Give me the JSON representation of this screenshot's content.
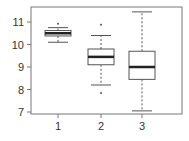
{
  "chart_data": {
    "type": "box",
    "title": "",
    "xlabel": "",
    "ylabel": "",
    "categories": [
      "1",
      "2",
      "3"
    ],
    "ylim": [
      6.95,
      11.5
    ],
    "yticks": [
      7,
      8,
      9,
      10,
      11
    ],
    "ytick_labels": [
      "7",
      "8",
      "9",
      "10",
      "11"
    ],
    "xtick_labels": [
      "1",
      "2",
      "3"
    ],
    "grid": false,
    "legend": null,
    "boxes": [
      {
        "label": "1",
        "whisker_low": 10.1,
        "q1": 10.38,
        "median": 10.5,
        "q3": 10.62,
        "whisker_high": 10.75,
        "outliers": [
          10.92
        ]
      },
      {
        "label": "2",
        "whisker_low": 8.2,
        "q1": 9.1,
        "median": 9.45,
        "q3": 9.8,
        "whisker_high": 10.4,
        "outliers": [
          7.85,
          10.88
        ]
      },
      {
        "label": "3",
        "whisker_low": 7.05,
        "q1": 8.45,
        "median": 9.0,
        "q3": 9.7,
        "whisker_high": 11.45,
        "outliers": []
      }
    ]
  }
}
